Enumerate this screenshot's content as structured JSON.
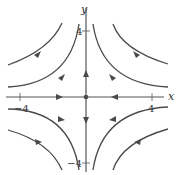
{
  "diagram": {
    "axes": {
      "x_label": "x",
      "y_label": "y",
      "x_ticks": [
        {
          "value": -4,
          "label": "-4"
        },
        {
          "value": 4,
          "label": "4"
        }
      ],
      "y_ticks": [
        {
          "value": 4,
          "label": "4"
        },
        {
          "value": -4,
          "label": "-4"
        }
      ],
      "x_tick_label_neg": "−4",
      "x_tick_label_pos": "4",
      "y_tick_label_pos": "4",
      "y_tick_label_neg": "−4"
    },
    "equilibrium": {
      "x": 0,
      "y": 0,
      "type": "saddle"
    },
    "flow": {
      "x_axis": "inward (toward origin)",
      "y_axis": "outward (away from origin)",
      "trajectories": "hyperbolas entering horizontally, exiting vertically"
    },
    "colors": {
      "curve": "#4a4a4a",
      "axis": "#555555",
      "background": "#ffffff"
    }
  }
}
